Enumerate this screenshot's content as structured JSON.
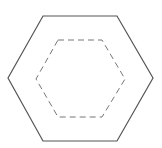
{
  "diagram": {
    "title": "",
    "shapes": [
      {
        "name": "outer-hexagon",
        "style": "solid",
        "stroke": "#555555",
        "points": "43,16 117,16 153,78 117,141 43,141 8,78"
      },
      {
        "name": "inner-hexagon",
        "style": "dashed",
        "stroke": "#777777",
        "points": "58,40 102,40 125,79 102,117 58,117 36,79"
      }
    ]
  }
}
